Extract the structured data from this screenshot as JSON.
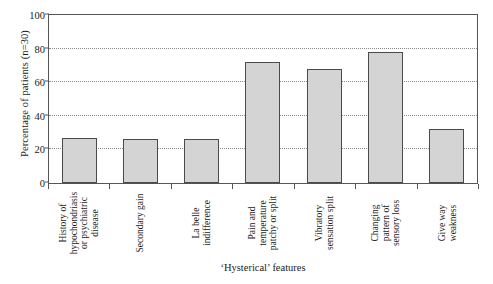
{
  "chart_data": {
    "type": "bar",
    "title": "",
    "xlabel": "‘Hysterical’ features",
    "ylabel": "Percentage of patients (n=30)",
    "ylim": [
      0,
      100
    ],
    "yticks": [
      0,
      20,
      40,
      60,
      80,
      100
    ],
    "gridlines": [
      20,
      40,
      60,
      80
    ],
    "grid": true,
    "legend": "none",
    "bar_fill_color": "#d4d4d4",
    "bar_edge_color": "#4a4a4a",
    "categories": [
      "History of hypochondriasis or psychiatric disease",
      "Secondary gain",
      "La belle indifference",
      "Pain and temperature patchy or split",
      "Vibratory sensation split",
      "Changing pattern of sensory loss",
      "Give way weakness"
    ],
    "category_lines": [
      [
        "History of",
        "hypochondriasis",
        "or psychiatric",
        "disease"
      ],
      [
        "Secondary gain"
      ],
      [
        "La belle",
        "indifference"
      ],
      [
        "Pain and",
        "temperature",
        "patchy or split"
      ],
      [
        "Vibratory",
        "sensation split"
      ],
      [
        "Changing",
        "pattern of",
        "sensory loss"
      ],
      [
        "Give way",
        "weakness"
      ]
    ],
    "values": [
      27,
      26,
      26,
      72,
      68,
      78,
      32
    ]
  }
}
